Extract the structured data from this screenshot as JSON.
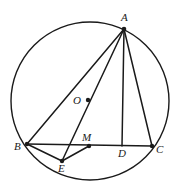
{
  "figure": {
    "stroke_color": "#1a1a1a",
    "fill_color": "#ffffff",
    "background": "#ffffff",
    "circle": {
      "label": "circumcircle",
      "cx": 90,
      "cy": 101,
      "r": 79
    },
    "points": [
      {
        "id": "A",
        "label": "A",
        "x": 124,
        "y": 29,
        "label_x": 121,
        "label_y": 21,
        "dot": true
      },
      {
        "id": "B",
        "label": "B",
        "x": 27,
        "y": 144,
        "label_x": 14,
        "label_y": 150,
        "dot": true
      },
      {
        "id": "C",
        "label": "C",
        "x": 152,
        "y": 146,
        "label_x": 156,
        "label_y": 153,
        "dot": true
      },
      {
        "id": "D",
        "label": "D",
        "x": 122,
        "y": 146,
        "label_x": 118,
        "label_y": 157,
        "dot": false
      },
      {
        "id": "E",
        "label": "E",
        "x": 62,
        "y": 161,
        "label_x": 58,
        "label_y": 172,
        "dot": true
      },
      {
        "id": "M",
        "label": "M",
        "x": 89,
        "y": 146,
        "label_x": 82,
        "label_y": 141,
        "dot": true
      },
      {
        "id": "O",
        "label": "O",
        "x": 88,
        "y": 100,
        "label_x": 73,
        "label_y": 104,
        "dot": true
      }
    ],
    "segments": [
      {
        "name": "segment-AB",
        "from": "A",
        "to": "B"
      },
      {
        "name": "segment-AC",
        "from": "A",
        "to": "C"
      },
      {
        "name": "segment-BC",
        "from": "B",
        "to": "C"
      },
      {
        "name": "segment-AD",
        "from": "A",
        "to": "D"
      },
      {
        "name": "segment-AE",
        "from": "A",
        "to": "E"
      },
      {
        "name": "segment-BE",
        "from": "B",
        "to": "E"
      },
      {
        "name": "segment-EM",
        "from": "E",
        "to": "M"
      }
    ]
  }
}
